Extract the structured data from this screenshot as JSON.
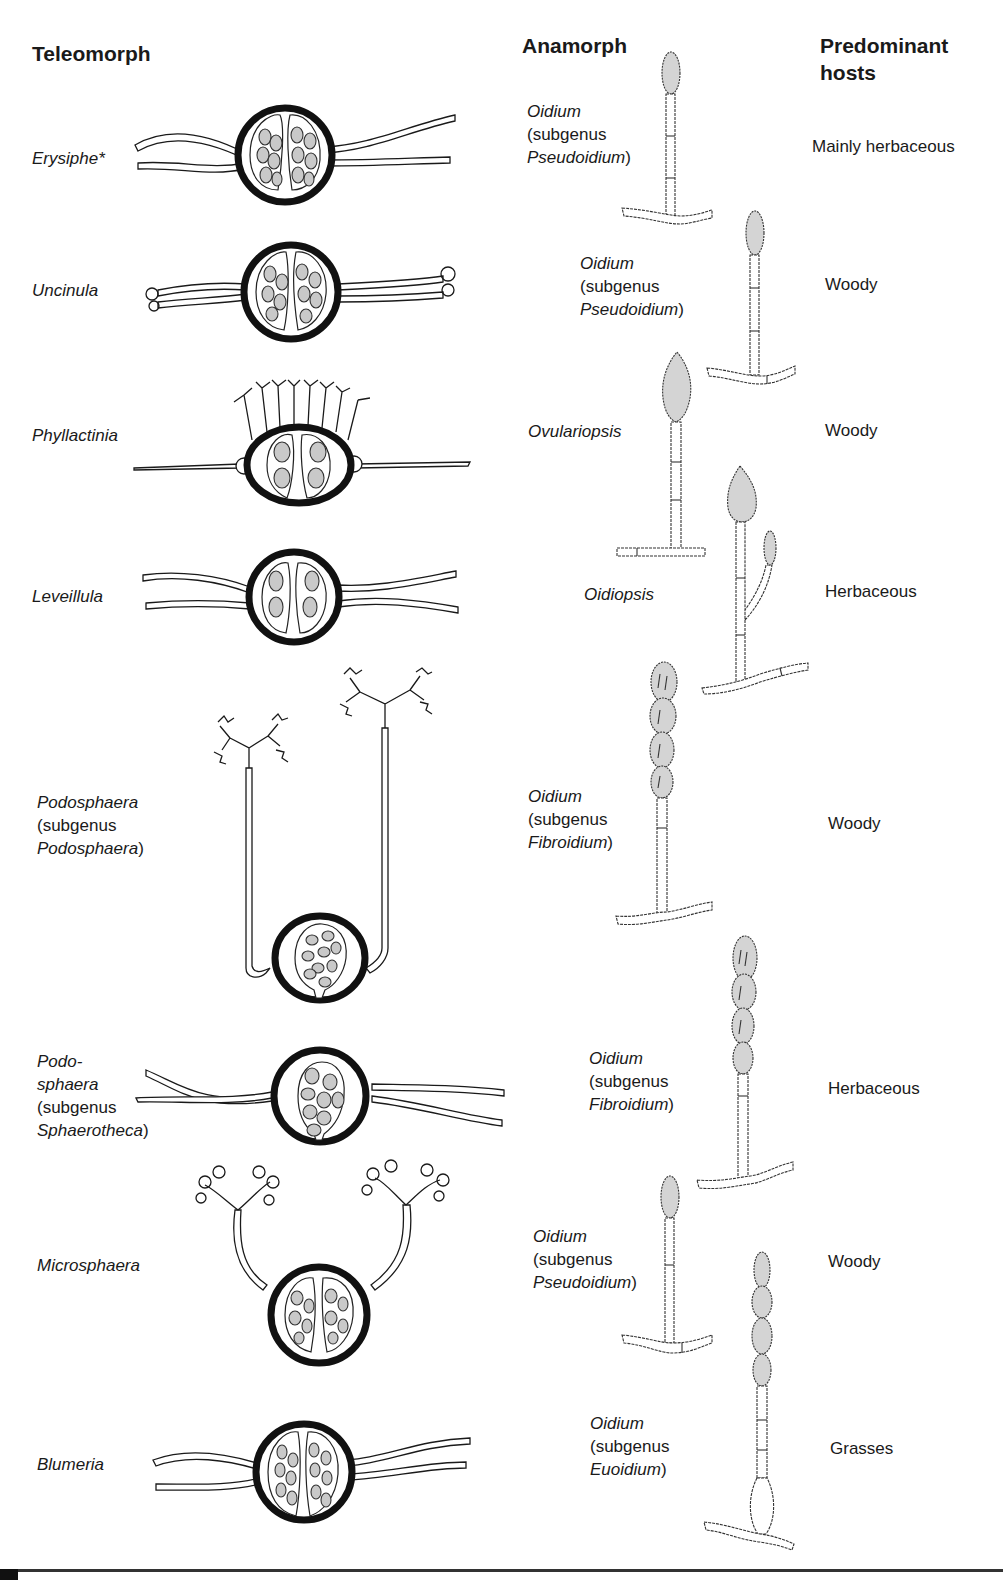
{
  "headers": {
    "teleomorph": "Teleomorph",
    "anamorph": "Anamorph",
    "hosts_line1": "Predominant",
    "hosts_line2": "hosts"
  },
  "rows": [
    {
      "teleomorph": {
        "genus": "Erysiphe*",
        "subgenus": null
      },
      "anamorph": {
        "genus": "Oidium",
        "prefix": "(subgenus",
        "subgenus": "Pseudoidium",
        "suffix": ")"
      },
      "host": "Mainly herbaceous"
    },
    {
      "teleomorph": {
        "genus": "Uncinula",
        "subgenus": null
      },
      "anamorph": {
        "genus": "Oidium",
        "prefix": "(subgenus",
        "subgenus": "Pseudoidium",
        "suffix": ")"
      },
      "host": "Woody"
    },
    {
      "teleomorph": {
        "genus": "Phyllactinia",
        "subgenus": null
      },
      "anamorph": {
        "genus": "Ovulariopsis"
      },
      "host": "Woody"
    },
    {
      "teleomorph": {
        "genus": "Leveillula",
        "subgenus": null
      },
      "anamorph": {
        "genus": "Oidiopsis"
      },
      "host": "Herbaceous"
    },
    {
      "teleomorph": {
        "genus": "Podosphaera",
        "prefix": "(subgenus",
        "subgenus": "Podosphaera",
        "suffix": ")"
      },
      "anamorph": {
        "genus": "Oidium",
        "prefix": "(subgenus",
        "subgenus": "Fibroidium",
        "suffix": ")"
      },
      "host": "Woody"
    },
    {
      "teleomorph": {
        "genus_line1": "Podo-",
        "genus_line2": "sphaera",
        "prefix": "(subgenus",
        "subgenus": "Sphaerotheca",
        "suffix": ")"
      },
      "anamorph": {
        "genus": "Oidium",
        "prefix": "(subgenus",
        "subgenus": "Fibroidium",
        "suffix": ")"
      },
      "host": "Herbaceous"
    },
    {
      "teleomorph": {
        "genus": "Microsphaera",
        "subgenus": null
      },
      "anamorph": {
        "genus": "Oidium",
        "prefix": "(subgenus",
        "subgenus": "Pseudoidium",
        "suffix": ")"
      },
      "host": "Woody"
    },
    {
      "teleomorph": {
        "genus": "Blumeria",
        "subgenus": null
      },
      "anamorph": {
        "genus": "Oidium",
        "prefix": "(subgenus",
        "subgenus": "Euoidium",
        "suffix": ")"
      },
      "host": "Grasses"
    }
  ],
  "colors": {
    "ink": "#1a1a1a",
    "spore_fill": "#c9c9c9",
    "background": "#ffffff"
  }
}
